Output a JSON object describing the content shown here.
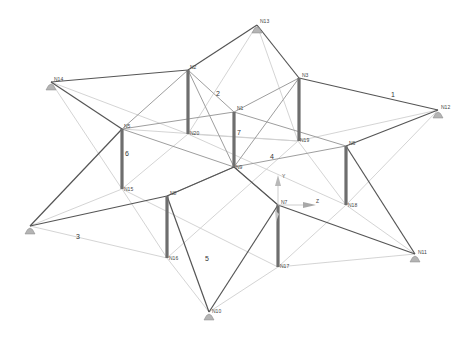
{
  "diagram": {
    "type": "3d-structural-frame-model",
    "background": "#ffffff",
    "colors": {
      "top_beam": "#555555",
      "diagonal_dark": "#6a6a6a",
      "diagonal_mid": "#9a9a9a",
      "diagonal_light": "#c8c8c8",
      "column": "#6e6e6e",
      "support": "#a8a8a8",
      "axis": "#b0b0b0"
    },
    "nodes": [
      {
        "id": "N1",
        "label": "N1",
        "x": 234,
        "y": 112
      },
      {
        "id": "N2",
        "label": "N2",
        "x": 188,
        "y": 70
      },
      {
        "id": "N3",
        "label": "N3",
        "x": 299,
        "y": 78
      },
      {
        "id": "N5",
        "label": "N5",
        "x": 122,
        "y": 129
      },
      {
        "id": "N6",
        "label": "N6",
        "x": 346,
        "y": 146
      },
      {
        "id": "N7",
        "label": "N7",
        "x": 278,
        "y": 205
      },
      {
        "id": "N8",
        "label": "N8",
        "x": 167,
        "y": 196
      },
      {
        "id": "N9",
        "label": "N9",
        "x": 234,
        "y": 167
      },
      {
        "id": "N10",
        "label": "N10",
        "x": 209,
        "y": 312
      },
      {
        "id": "N11",
        "label": "N11",
        "x": 415,
        "y": 254
      },
      {
        "id": "N12",
        "label": "N12",
        "x": 438,
        "y": 110
      },
      {
        "id": "N13",
        "label": "N13",
        "x": 257,
        "y": 25
      },
      {
        "id": "N14",
        "label": "N14",
        "x": 51,
        "y": 82
      },
      {
        "id": "N15",
        "label": "N15",
        "x": 122,
        "y": 189
      },
      {
        "id": "N16",
        "label": "N16",
        "x": 167,
        "y": 258
      },
      {
        "id": "N17",
        "label": "N17",
        "x": 278,
        "y": 267
      },
      {
        "id": "N18",
        "label": "N18",
        "x": 346,
        "y": 205
      },
      {
        "id": "N19",
        "label": "N19",
        "x": 298,
        "y": 141
      },
      {
        "id": "N20",
        "label": "N20",
        "x": 188,
        "y": 134
      },
      {
        "id": "N21",
        "label": "N21",
        "x": 30,
        "y": 226
      }
    ],
    "supports": [
      "N10",
      "N11",
      "N12",
      "N13",
      "N14",
      "N21"
    ],
    "member_labels": [
      {
        "text": "1",
        "x": 391,
        "y": 97
      },
      {
        "text": "2",
        "x": 218,
        "y": 96
      },
      {
        "text": "3",
        "x": 77,
        "y": 237
      },
      {
        "text": "4",
        "x": 272,
        "y": 157
      },
      {
        "text": "5",
        "x": 207,
        "y": 261
      },
      {
        "text": "6",
        "x": 126,
        "y": 154
      },
      {
        "text": "7",
        "x": 238,
        "y": 133
      }
    ],
    "axes": {
      "origin": {
        "x": 278,
        "y": 205
      },
      "x_label": "Z",
      "y_label": "Y",
      "z_label": "X"
    }
  }
}
